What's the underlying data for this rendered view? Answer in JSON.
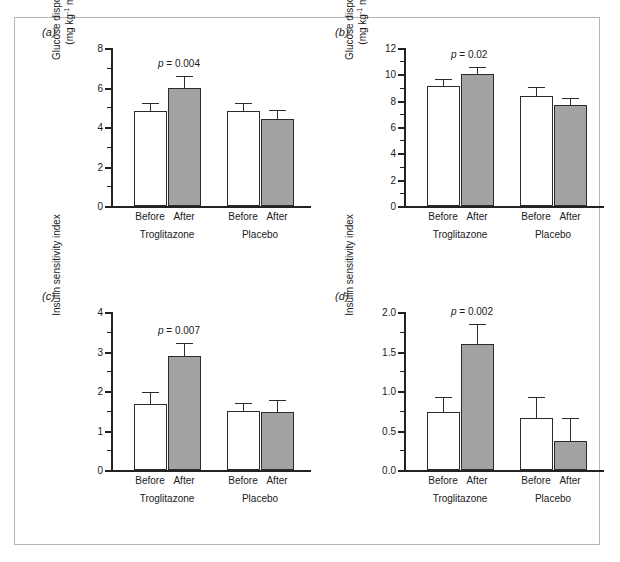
{
  "figure": {
    "panel_letters": [
      "(a)",
      "(b)",
      "(c)",
      "(d)"
    ],
    "group_labels": [
      "Troglitazone",
      "Placebo"
    ],
    "condition_labels": [
      "Before",
      "After",
      "Before",
      "After"
    ],
    "bar_colors": {
      "before": "#ffffff",
      "after": "#a3a3a3",
      "outline": "#2b2b2b"
    }
  },
  "chart_data": [
    {
      "type": "bar",
      "panel": "(a)",
      "title": "",
      "xlabel": "",
      "ylabel": "Glucose disposal rate (mg kg-1 min-1)",
      "ylabel_line1": "Glucose disposal rate",
      "ylabel_line2_pre": "(mg kg",
      "ylabel_line2_mid": " min",
      "ylabel_line2_post": ")",
      "ylabel_sup": "-1",
      "ylim": [
        0,
        8
      ],
      "yticks": [
        0,
        2,
        4,
        6,
        8
      ],
      "ytick_labels": [
        "0",
        "2",
        "4",
        "6",
        "8"
      ],
      "yminor_step": 1,
      "grid": false,
      "legend": "none",
      "categories": [
        "Before",
        "After",
        "Before",
        "After"
      ],
      "groups": [
        "Troglitazone",
        "Troglitazone",
        "Placebo",
        "Placebo"
      ],
      "values": [
        4.8,
        6.0,
        4.8,
        4.4
      ],
      "errors": [
        0.35,
        0.55,
        0.35,
        0.4
      ],
      "annotation": {
        "p_symbol": "p",
        "p_text": "= 0.004",
        "full": "p = 0.004"
      }
    },
    {
      "type": "bar",
      "panel": "(b)",
      "title": "",
      "xlabel": "",
      "ylabel": "Glucose disposal rate (mg kg-1 min-1)",
      "ylabel_line1": "Glucose disposal rate",
      "ylabel_line2_pre": "(mg kg",
      "ylabel_line2_mid": " min",
      "ylabel_line2_post": ")",
      "ylabel_sup": "-1",
      "ylim": [
        0,
        12
      ],
      "yticks": [
        0,
        2,
        4,
        6,
        8,
        10,
        12
      ],
      "ytick_labels": [
        "0",
        "2",
        "4",
        "6",
        "8",
        "10",
        "12"
      ],
      "yminor_step": 1,
      "grid": false,
      "legend": "none",
      "categories": [
        "Before",
        "After",
        "Before",
        "After"
      ],
      "groups": [
        "Troglitazone",
        "Troglitazone",
        "Placebo",
        "Placebo"
      ],
      "values": [
        9.1,
        10.05,
        8.35,
        7.7
      ],
      "errors": [
        0.5,
        0.45,
        0.65,
        0.4
      ],
      "annotation": {
        "p_symbol": "p",
        "p_text": "= 0.02",
        "full": "p = 0.02"
      }
    },
    {
      "type": "bar",
      "panel": "(c)",
      "title": "",
      "xlabel": "",
      "ylabel": "Insulin sensitivity index",
      "ylim": [
        0,
        4
      ],
      "yticks": [
        0,
        1,
        2,
        3,
        4
      ],
      "ytick_labels": [
        "0",
        "1",
        "2",
        "3",
        "4"
      ],
      "yminor_step": 0.5,
      "grid": false,
      "legend": "none",
      "categories": [
        "Before",
        "After",
        "Before",
        "After"
      ],
      "groups": [
        "Troglitazone",
        "Troglitazone",
        "Placebo",
        "Placebo"
      ],
      "values": [
        1.66,
        2.89,
        1.5,
        1.48
      ],
      "errors": [
        0.3,
        0.3,
        0.17,
        0.27
      ],
      "annotation": {
        "p_symbol": "p",
        "p_text": "= 0.007",
        "full": "p = 0.007"
      }
    },
    {
      "type": "bar",
      "panel": "(d)",
      "title": "",
      "xlabel": "",
      "ylabel": "Insulin sensitivity index",
      "ylim": [
        0,
        2
      ],
      "yticks": [
        0,
        0.5,
        1,
        1.5,
        2
      ],
      "ytick_labels": [
        "0.0",
        "0.5",
        "1.0",
        "1.5",
        "2.0"
      ],
      "yminor_step": 0.25,
      "grid": false,
      "legend": "none",
      "categories": [
        "Before",
        "After",
        "Before",
        "After"
      ],
      "groups": [
        "Troglitazone",
        "Troglitazone",
        "Placebo",
        "Placebo"
      ],
      "values": [
        0.74,
        1.59,
        0.66,
        0.37
      ],
      "errors": [
        0.17,
        0.25,
        0.25,
        0.28
      ],
      "annotation": {
        "p_symbol": "p",
        "p_text": "= 0.002",
        "full": "p = 0.002"
      }
    }
  ]
}
